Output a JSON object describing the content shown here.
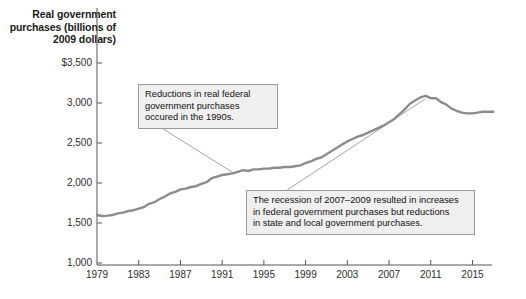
{
  "chart_data": {
    "type": "line",
    "title": "Real government purchases (billions of 2009 dollars)",
    "xlabel": "",
    "ylabel": "Real government purchases (billions of 2009 dollars)",
    "xlim": [
      1979,
      2017
    ],
    "ylim": [
      1000,
      3500
    ],
    "grid": false,
    "legend": "none",
    "line_color": "#8c8c8c",
    "xticks": [
      "1979",
      "1983",
      "1987",
      "1991",
      "1995",
      "1999",
      "2003",
      "2007",
      "2011",
      "2015"
    ],
    "yticks": [
      "$3,500",
      "3,000",
      "2,500",
      "2,000",
      "1,500",
      "1,000"
    ],
    "x": [
      1979,
      1979.5,
      1980,
      1980.5,
      1981,
      1981.5,
      1982,
      1982.5,
      1983,
      1983.5,
      1984,
      1984.5,
      1985,
      1985.5,
      1986,
      1986.5,
      1987,
      1987.5,
      1988,
      1988.5,
      1989,
      1989.5,
      1990,
      1990.5,
      1991,
      1991.5,
      1992,
      1992.5,
      1993,
      1993.5,
      1994,
      1994.5,
      1995,
      1995.5,
      1996,
      1996.5,
      1997,
      1997.5,
      1998,
      1998.5,
      1999,
      1999.5,
      2000,
      2000.5,
      2001,
      2001.5,
      2002,
      2002.5,
      2003,
      2003.5,
      2004,
      2004.5,
      2005,
      2005.5,
      2006,
      2006.5,
      2007,
      2007.5,
      2008,
      2008.5,
      2009,
      2009.5,
      2010,
      2010.5,
      2011,
      2011.5,
      2012,
      2012.5,
      2013,
      2013.5,
      2014,
      2014.5,
      2015,
      2015.5,
      2016,
      2016.5,
      2017
    ],
    "values": [
      1600,
      1588,
      1592,
      1600,
      1620,
      1630,
      1650,
      1660,
      1680,
      1700,
      1740,
      1760,
      1800,
      1830,
      1870,
      1890,
      1920,
      1930,
      1950,
      1960,
      1990,
      2010,
      2060,
      2080,
      2100,
      2110,
      2120,
      2140,
      2160,
      2150,
      2170,
      2170,
      2180,
      2180,
      2190,
      2190,
      2200,
      2200,
      2210,
      2220,
      2250,
      2270,
      2300,
      2320,
      2360,
      2400,
      2440,
      2480,
      2520,
      2550,
      2580,
      2600,
      2630,
      2660,
      2690,
      2720,
      2760,
      2800,
      2860,
      2920,
      2990,
      3030,
      3070,
      3090,
      3060,
      3060,
      3010,
      2980,
      2930,
      2900,
      2880,
      2870,
      2870,
      2880,
      2890,
      2890,
      2890
    ],
    "annotations": [
      {
        "id": "callout-0",
        "text": "Reductions in real federal\ngovernment purchases\noccured in the 1990s.",
        "anchor_x": 232,
        "anchor_y": 172
      },
      {
        "id": "callout-1",
        "text": "The recession of 2007–2009 resulted in increases\nin federal government purchases but reductions\nin state and local government purchases.",
        "anchor_x": 425,
        "anchor_y": 99
      }
    ]
  },
  "axis": {
    "title": "Real government\npurchases (billions\nof 2009 dollars)",
    "y_labels": [
      "$3,500",
      "3,000",
      "2,500",
      "2,000",
      "1,500",
      "1,000"
    ],
    "x_labels": [
      "1979",
      "1983",
      "1987",
      "1991",
      "1995",
      "1999",
      "2003",
      "2007",
      "2011",
      "2015"
    ]
  }
}
